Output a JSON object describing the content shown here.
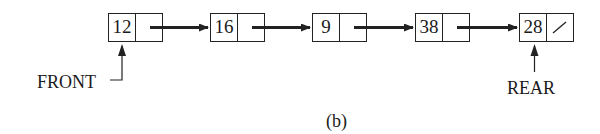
{
  "figure": {
    "caption": "(b)",
    "type": "linked-list-queue"
  },
  "nodes": [
    {
      "value": "12",
      "next": "pointer"
    },
    {
      "value": "16",
      "next": "pointer"
    },
    {
      "value": "9",
      "next": "pointer"
    },
    {
      "value": "38",
      "next": "pointer"
    },
    {
      "value": "28",
      "next": "null"
    }
  ],
  "pointers": {
    "front": {
      "label": "FRONT",
      "target_index": 0
    },
    "rear": {
      "label": "REAR",
      "target_index": 4
    }
  },
  "icons": {
    "null_pointer": "slash",
    "link_arrow": "right-arrow"
  },
  "colors": {
    "stroke": "#222222",
    "background": "#ffffff"
  }
}
